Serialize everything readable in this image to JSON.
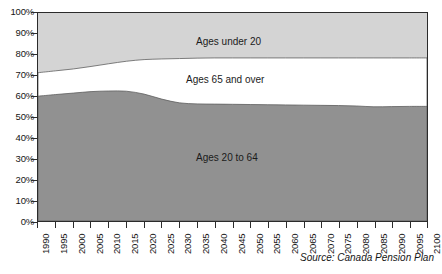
{
  "chart_data": {
    "type": "area",
    "title": "",
    "subtitle": "",
    "xlabel": "",
    "ylabel": "",
    "xlim": [
      1990,
      2100
    ],
    "ylim": [
      0,
      100
    ],
    "grid": false,
    "legend_position": "inline-band-labels",
    "stacked": true,
    "stack_order_bottom_to_top": [
      "Ages 20 to 64",
      "Ages 65 and over",
      "Ages under 20"
    ],
    "y_tick_labels": [
      "100%",
      "90%",
      "80%",
      "70%",
      "60%",
      "50%",
      "40%",
      "30%",
      "20%",
      "10%",
      "0%"
    ],
    "y_tick_values": [
      100,
      90,
      80,
      70,
      60,
      50,
      40,
      30,
      20,
      10,
      0
    ],
    "x_tick_labels": [
      "1990",
      "1995",
      "2000",
      "2005",
      "2010",
      "2015",
      "2020",
      "2025",
      "2030",
      "2035",
      "2040",
      "2045",
      "2050",
      "2055",
      "2060",
      "2065",
      "2070",
      "2075",
      "2080",
      "2085",
      "2090",
      "2095",
      "2100"
    ],
    "x": [
      1990,
      1995,
      2000,
      2005,
      2010,
      2015,
      2020,
      2025,
      2030,
      2035,
      2040,
      2045,
      2050,
      2055,
      2060,
      2065,
      2070,
      2075,
      2080,
      2085,
      2090,
      2095,
      2100
    ],
    "series": [
      {
        "name": "Ages 20 to 64",
        "color": "#919191",
        "values": [
          60.0,
          60.8,
          61.5,
          62.2,
          62.5,
          62.4,
          61.0,
          58.6,
          56.8,
          56.3,
          56.2,
          56.1,
          56.0,
          55.9,
          55.8,
          55.7,
          55.6,
          55.5,
          55.3,
          54.9,
          55.0,
          55.1,
          55.1
        ]
      },
      {
        "name": "Ages 65 and over",
        "color": "#ffffff",
        "values": [
          11.3,
          11.4,
          11.6,
          12.1,
          13.1,
          14.4,
          16.6,
          19.3,
          21.3,
          22.0,
          22.2,
          22.3,
          22.4,
          22.5,
          22.6,
          22.7,
          22.8,
          22.9,
          23.1,
          23.5,
          23.4,
          23.3,
          23.3
        ]
      },
      {
        "name": "Ages under 20",
        "color": "#d4d4d4",
        "values": [
          28.7,
          27.8,
          26.9,
          25.7,
          24.4,
          23.2,
          22.4,
          22.1,
          21.9,
          21.7,
          21.6,
          21.6,
          21.6,
          21.6,
          21.6,
          21.6,
          21.6,
          21.6,
          21.6,
          21.6,
          21.6,
          21.6,
          21.6
        ]
      }
    ],
    "cumulative_upper_boundaries": {
      "top_of_ages_20_to_64": [
        60.0,
        60.8,
        61.5,
        62.2,
        62.5,
        62.4,
        61.0,
        58.6,
        56.8,
        56.3,
        56.2,
        56.1,
        56.0,
        55.9,
        55.8,
        55.7,
        55.6,
        55.5,
        55.3,
        54.9,
        55.0,
        55.1,
        55.1
      ],
      "top_of_ages_65_and_over": [
        71.3,
        72.2,
        73.1,
        74.3,
        75.6,
        76.8,
        77.6,
        77.9,
        78.1,
        78.3,
        78.4,
        78.4,
        78.4,
        78.4,
        78.4,
        78.4,
        78.4,
        78.4,
        78.4,
        78.4,
        78.4,
        78.4,
        78.4
      ]
    },
    "annotations": [
      {
        "text": "Ages under 20",
        "series": "Ages under 20"
      },
      {
        "text": "Ages 65 and over",
        "series": "Ages 65 and over"
      },
      {
        "text": "Ages 20 to 64",
        "series": "Ages 20 to 64"
      }
    ],
    "source": "Source: Canada Pension Plan"
  },
  "labels": {
    "band_under20": "Ages under 20",
    "band_65over": "Ages 65 and over",
    "band_20to64": "Ages 20 to 64",
    "source": "Source: Canada Pension Plan"
  },
  "colors": {
    "band_under20": "#d4d4d4",
    "band_65over": "#ffffff",
    "band_20to64": "#919191",
    "axis": "#2b2b2b",
    "text": "#151515"
  }
}
